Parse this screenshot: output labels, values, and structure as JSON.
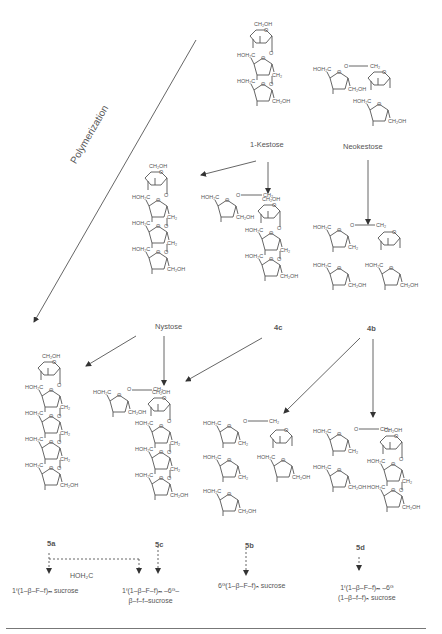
{
  "figure": {
    "polymerization_label": "Polymerization",
    "compounds": {
      "kestose": {
        "name": "1-Kestose"
      },
      "neokestose": {
        "name": "Neokestose"
      },
      "nystose": {
        "name": "Nystose"
      },
      "c4c": {
        "name": "4c"
      },
      "c4b": {
        "name": "4b"
      },
      "c5a": {
        "name": "5a"
      },
      "c5c": {
        "name": "5c"
      },
      "c5b": {
        "name": "5b"
      },
      "c5d": {
        "name": "5d"
      }
    },
    "groups": {
      "ch2oh": "CH₂OH",
      "hoh2c": "HOH₂C",
      "ch2": "CH₂",
      "o": "O"
    },
    "stray_label": "HOH₂C",
    "products": {
      "p5a": "1ᶠ(1–β–F–f)ₘ sucrose",
      "p5c_line1": "1ᶠ(1–β–F–f)ₘ –6ᴳ–",
      "p5c_line2": "β–f–f–sucrose",
      "p5b": "6ᴳ(1–β–F–f)ₙ sucrose",
      "p5d_line1": "1ᶠ(1–β–F–f)ₘ –6ᴳ",
      "p5d_line2": "(1–β–f–f)ₙ sucrose"
    },
    "arrows": [
      {
        "from": "1-Kestose",
        "to": "Nystose",
        "style": "solid"
      },
      {
        "from": "1-Kestose",
        "to": "4c",
        "style": "solid"
      },
      {
        "from": "Neokestose",
        "to": "4b",
        "style": "solid"
      },
      {
        "from": "Nystose",
        "to": "5a",
        "style": "solid"
      },
      {
        "from": "Nystose",
        "to": "5c",
        "style": "solid"
      },
      {
        "from": "4c",
        "to": "5c",
        "style": "solid"
      },
      {
        "from": "4b",
        "to": "5b",
        "style": "solid"
      },
      {
        "from": "4b",
        "to": "5d",
        "style": "solid"
      },
      {
        "from": "Polymerization",
        "to": "5a",
        "style": "solid"
      },
      {
        "from": "5a",
        "to": "1F(1-β-F-f)m sucrose",
        "style": "dashed"
      },
      {
        "from": "5a",
        "to": "1F(1-β-F-f)m-6G-β-f-f-sucrose",
        "style": "dashed"
      },
      {
        "from": "5c",
        "to": "1F(1-β-F-f)m-6G-β-f-f-sucrose",
        "style": "dashed"
      },
      {
        "from": "5b",
        "to": "6G(1-β-F-f)n sucrose",
        "style": "dashed"
      },
      {
        "from": "5d",
        "to": "1F(1-β-F-f)m-6G(1-β-f-f)n sucrose",
        "style": "dashed"
      }
    ],
    "colors": {
      "ink": "#444444",
      "line": "#555555",
      "background": "#ffffff"
    }
  }
}
